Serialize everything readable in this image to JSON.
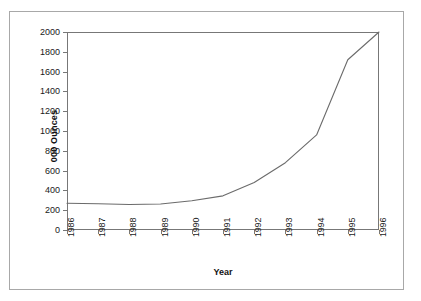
{
  "chart_data": {
    "type": "line",
    "title": "",
    "xlabel": "Year",
    "ylabel": "000 Ounces",
    "categories": [
      "1986",
      "1987",
      "1988",
      "1989",
      "1990",
      "1991",
      "1992",
      "1993",
      "1994",
      "1995",
      "1996"
    ],
    "x": [
      1986,
      1987,
      1988,
      1989,
      1990,
      1991,
      1992,
      1993,
      1994,
      1995,
      1996
    ],
    "values": [
      270,
      265,
      258,
      262,
      295,
      345,
      480,
      680,
      960,
      1720,
      2000
    ],
    "series": [
      {
        "name": "000 Ounces",
        "values": [
          270,
          265,
          258,
          262,
          295,
          345,
          480,
          680,
          960,
          1720,
          2000
        ]
      }
    ],
    "ylim": [
      0,
      2000
    ],
    "ytick_values": [
      0,
      200,
      400,
      600,
      800,
      1000,
      1200,
      1400,
      1600,
      1800,
      2000
    ],
    "ytick_labels": [
      "0",
      "200",
      "400",
      "600",
      "800",
      "1000",
      "1200",
      "1400",
      "1600",
      "1800",
      "2000"
    ],
    "xlim": [
      1986,
      1996
    ],
    "grid": false,
    "legend": false,
    "legend_position": "none",
    "line_color": "#6b6b6b",
    "axis_color": "#777777",
    "border_color": "#a8a8a8",
    "background_color": "#ffffff"
  }
}
